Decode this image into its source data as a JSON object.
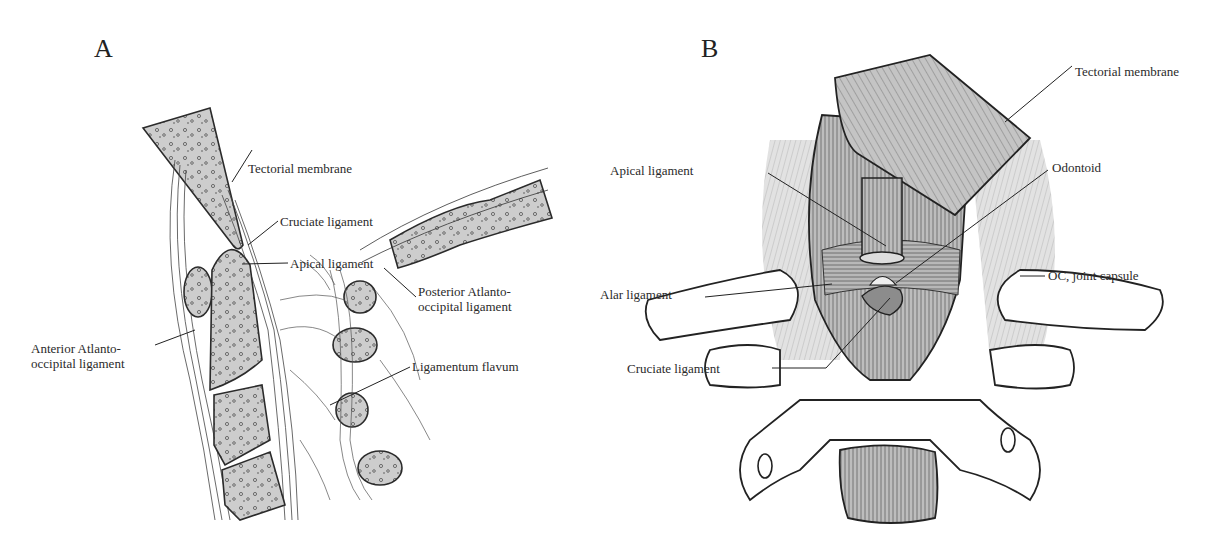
{
  "figure": {
    "panel_a": {
      "letter": "A",
      "view": "sagittal",
      "labels": {
        "tectorial_membrane": "Tectorial membrane",
        "cruciate_ligament": "Cruciate ligament",
        "apical_ligament": "Apical ligament",
        "posterior_ao_line1": "Posterior Atlanto-",
        "posterior_ao_line2": "occipital ligament",
        "anterior_ao_line1": "Anterior Atlanto-",
        "anterior_ao_line2": "occipital ligament",
        "ligamentum_flavum": "Ligamentum flavum"
      }
    },
    "panel_b": {
      "letter": "B",
      "view": "posterior (coronal)",
      "labels": {
        "tectorial_membrane": "Tectorial membrane",
        "apical_ligament": "Apical ligament",
        "odontoid": "Odontoid",
        "alar_ligament": "Alar ligament",
        "oc_joint_capsule": "OC, joint capsule",
        "cruciate_ligament": "Cruciate ligament"
      }
    },
    "colors": {
      "bone_fill": "#cfcfcf",
      "ligament_fill": "#b5b5b5",
      "line": "#2b2b2b",
      "text": "#2a2a2a"
    }
  }
}
